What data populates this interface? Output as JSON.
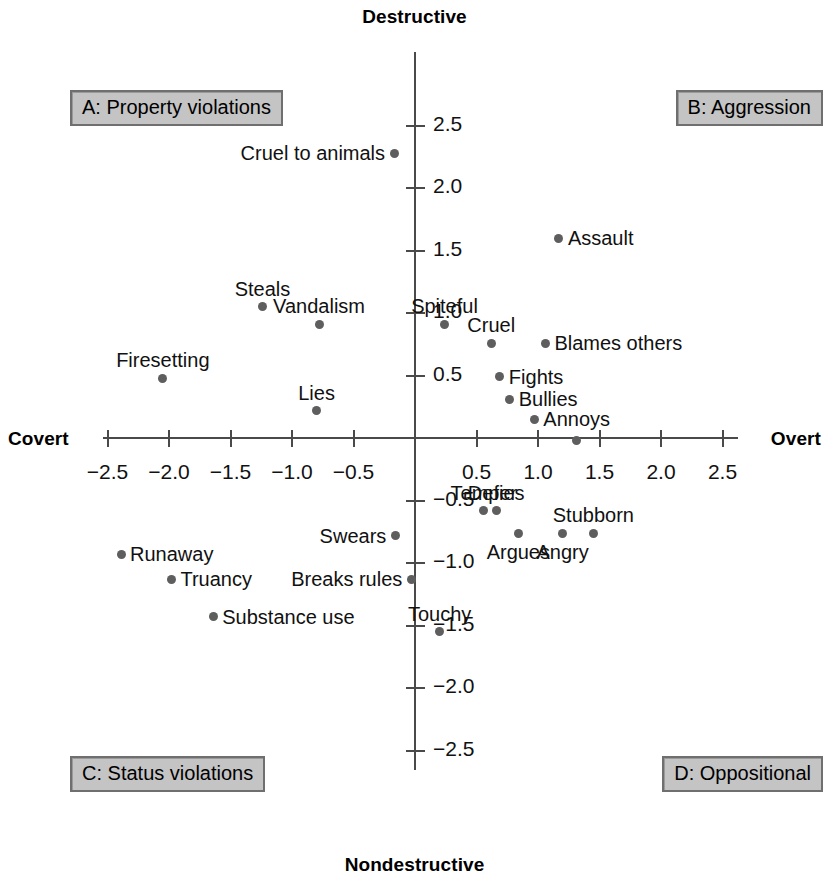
{
  "figure": {
    "axis_poles": {
      "top": "Destructive",
      "bottom": "Nondestructive",
      "left": "Covert",
      "right": "Overt"
    },
    "quadrants": [
      {
        "key": "A",
        "label": "A: Property violations"
      },
      {
        "key": "B",
        "label": "B: Aggression"
      },
      {
        "key": "C",
        "label": "C: Status violations"
      },
      {
        "key": "D",
        "label": "D: Oppositional"
      }
    ],
    "colors": {
      "point": "#5e5e5e",
      "axis": "#4a4a4a",
      "quadrant_box_fill": "#c4c4c4",
      "quadrant_box_border": "#6f6f6f",
      "background": "#ffffff",
      "text": "#111111"
    }
  },
  "chart_data": {
    "type": "scatter",
    "title": "",
    "subtitle": "",
    "xlabel": "Covert – Overt",
    "ylabel": "Nondestructive – Destructive",
    "xlim": [
      -2.75,
      2.75
    ],
    "ylim": [
      -2.75,
      2.75
    ],
    "grid": false,
    "legend": null,
    "xticks": [
      -2.5,
      -2.0,
      -1.5,
      -1.0,
      -0.5,
      0.5,
      1.0,
      1.5,
      2.0,
      2.5
    ],
    "xticklabels": [
      "−2.5",
      "−2.0",
      "−1.5",
      "−1.0",
      "−0.5",
      "0.5",
      "1.0",
      "1.5",
      "2.0",
      "2.5"
    ],
    "yticks": [
      2.5,
      2.0,
      1.5,
      1.0,
      0.5,
      -0.5,
      -1.0,
      -1.5,
      -2.0,
      -2.5
    ],
    "yticklabels": [
      "2.5",
      "2.0",
      "1.5",
      "1.0",
      "0.5",
      "−0.5",
      "−1.0",
      "−1.5",
      "−2.0",
      "−2.5"
    ],
    "annotations": [
      {
        "label": "A: Property violations",
        "quadrant": "A"
      },
      {
        "label": "B: Aggression",
        "quadrant": "B"
      },
      {
        "label": "C: Status violations",
        "quadrant": "C"
      },
      {
        "label": "D: Oppositional",
        "quadrant": "D"
      }
    ],
    "points": [
      {
        "label": "Cruel to animals",
        "x": -0.17,
        "y": 2.28,
        "label_pos": "left",
        "quadrant": "A"
      },
      {
        "label": "Steals",
        "x": -1.24,
        "y": 1.05,
        "label_pos": "above",
        "quadrant": "A"
      },
      {
        "label": "Vandalism",
        "x": -0.78,
        "y": 0.91,
        "label_pos": "above",
        "quadrant": "A"
      },
      {
        "label": "Firesetting",
        "x": -2.05,
        "y": 0.48,
        "label_pos": "above",
        "quadrant": "A"
      },
      {
        "label": "Lies",
        "x": -0.8,
        "y": 0.22,
        "label_pos": "above",
        "quadrant": "A"
      },
      {
        "label": "Assault",
        "x": 1.17,
        "y": 1.6,
        "label_pos": "right",
        "quadrant": "B"
      },
      {
        "label": "Spiteful",
        "x": 0.24,
        "y": 0.91,
        "label_pos": "above",
        "quadrant": "B"
      },
      {
        "label": "Cruel",
        "x": 0.62,
        "y": 0.76,
        "label_pos": "above",
        "quadrant": "B"
      },
      {
        "label": "Blames others",
        "x": 1.06,
        "y": 0.76,
        "label_pos": "right",
        "quadrant": "B"
      },
      {
        "label": "Fights",
        "x": 0.69,
        "y": 0.49,
        "label_pos": "right",
        "quadrant": "B"
      },
      {
        "label": "Bullies",
        "x": 0.77,
        "y": 0.31,
        "label_pos": "right",
        "quadrant": "B"
      },
      {
        "label": "Annoys",
        "x": 0.97,
        "y": 0.15,
        "label_pos": "right",
        "quadrant": "B"
      },
      {
        "label": "Runaway",
        "x": -2.39,
        "y": -0.93,
        "label_pos": "right",
        "quadrant": "C"
      },
      {
        "label": "Truancy",
        "x": -1.98,
        "y": -1.13,
        "label_pos": "right",
        "quadrant": "C"
      },
      {
        "label": "Substance use",
        "x": -1.64,
        "y": -1.43,
        "label_pos": "right",
        "quadrant": "C"
      },
      {
        "label": "Swears",
        "x": -0.16,
        "y": -0.78,
        "label_pos": "left",
        "quadrant": "C"
      },
      {
        "label": "Breaks rules",
        "x": -0.03,
        "y": -1.13,
        "label_pos": "left",
        "quadrant": "C"
      },
      {
        "label": "Temper",
        "x": 0.56,
        "y": -0.58,
        "label_pos": "above",
        "quadrant": "D"
      },
      {
        "label": "Defies",
        "x": 0.66,
        "y": -0.58,
        "label_pos": "above",
        "quadrant": "D"
      },
      {
        "label": "Argues",
        "x": 0.84,
        "y": -0.76,
        "label_pos": "below",
        "quadrant": "D"
      },
      {
        "label": "Angry",
        "x": 1.2,
        "y": -0.76,
        "label_pos": "below",
        "quadrant": "D"
      },
      {
        "label": "Stubborn",
        "x": 1.45,
        "y": -0.76,
        "label_pos": "above",
        "quadrant": "D"
      },
      {
        "label": "Touchy",
        "x": 0.2,
        "y": -1.55,
        "label_pos": "above",
        "quadrant": "D"
      },
      {
        "label": "",
        "x": 1.31,
        "y": -0.02,
        "label_pos": "none",
        "quadrant": "D"
      }
    ]
  }
}
